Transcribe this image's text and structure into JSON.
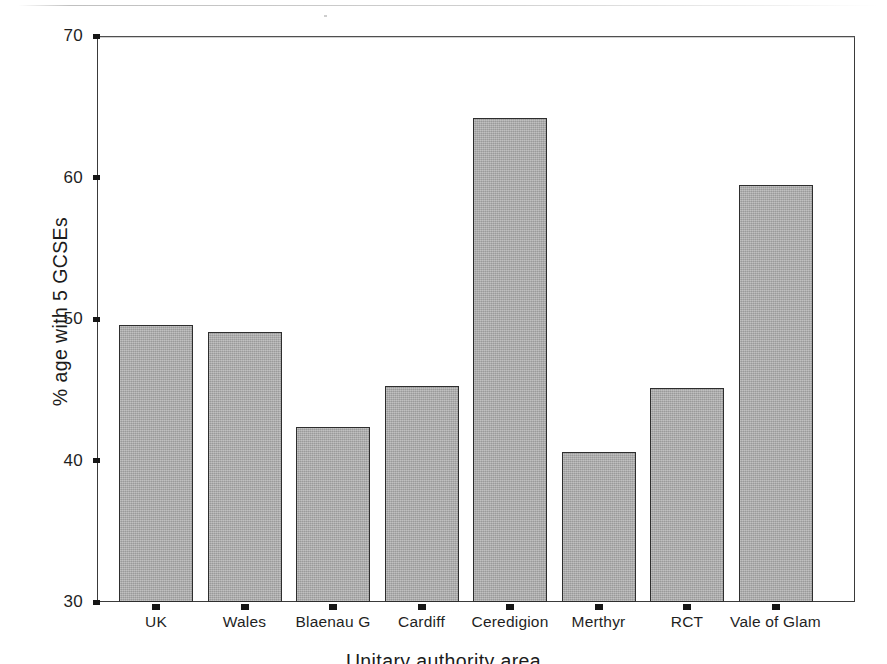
{
  "chart_data": {
    "type": "bar",
    "title": "",
    "xlabel": "Unitary authority area",
    "ylabel": "% age with 5 GCSEs",
    "categories": [
      "UK",
      "Wales",
      "Blaenau G",
      "Cardiff",
      "Ceredigion",
      "Merthyr",
      "RCT",
      "Vale of Glam"
    ],
    "values": [
      49.6,
      49.1,
      42.4,
      45.3,
      64.2,
      40.6,
      45.1,
      59.5
    ],
    "ylim": [
      30,
      70
    ],
    "yticks": [
      30,
      40,
      50,
      60,
      70
    ],
    "ytick_labels": [
      "30",
      "40",
      "50",
      "60",
      "70"
    ],
    "grid": false,
    "legend": null,
    "bar_fill_color": "#a9a9a9",
    "bar_edge_color": "#2e2e2e",
    "axis_color": "#3a3a3a"
  },
  "figure": {
    "background_color": "#ffffff",
    "x_axis_title_clipped": true
  }
}
